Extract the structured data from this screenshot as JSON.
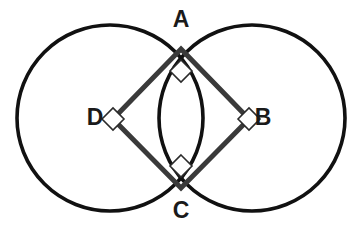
{
  "figure": {
    "background_color": "#ffffff",
    "canvas": {
      "width": 361,
      "height": 241
    },
    "circle_color": "#111111",
    "circle_stroke_width": 3.6,
    "square_color": "#3a3a3a",
    "square_stroke_width": 5,
    "marker_color": "#2b2b2b",
    "marker_stroke_width": 1.6,
    "marker_fill": "#ffffff",
    "label_color": "#1a1a1a"
  },
  "circles": [
    {
      "name": "left-circle",
      "cx": 110,
      "cy": 118,
      "r": 93
    },
    {
      "name": "right-circle",
      "cx": 252,
      "cy": 118,
      "r": 93
    }
  ],
  "square": {
    "name": "square-ABCD",
    "points": "181,49 249,119 181,188 113,119",
    "vertices": [
      {
        "id": "A",
        "x": 181,
        "y": 49
      },
      {
        "id": "B",
        "x": 249,
        "y": 119
      },
      {
        "id": "C",
        "x": 181,
        "y": 188
      },
      {
        "id": "D",
        "x": 113,
        "y": 119
      }
    ]
  },
  "right_angle_markers": [
    {
      "at": "A",
      "points": "181,60 192,71 181,82 170,71"
    },
    {
      "at": "B",
      "points": "238,119 249,108 260,119 249,130"
    },
    {
      "at": "C",
      "points": "181,155 192,166 181,177 170,166"
    },
    {
      "at": "D",
      "points": "102,119 113,108 124,119 113,130"
    }
  ],
  "labels": [
    {
      "id": "label-A",
      "text": "A",
      "x": 181,
      "y": 21,
      "anchor": "middle"
    },
    {
      "id": "label-B",
      "text": "B",
      "x": 263,
      "y": 119,
      "anchor": "middle"
    },
    {
      "id": "label-C",
      "text": "C",
      "x": 181,
      "y": 212,
      "anchor": "middle"
    },
    {
      "id": "label-D",
      "text": "D",
      "x": 95,
      "y": 119,
      "anchor": "middle"
    }
  ]
}
